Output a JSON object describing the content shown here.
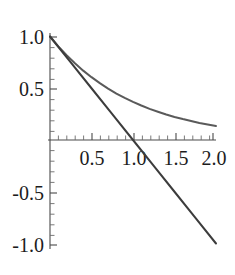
{
  "chart_data": {
    "type": "line",
    "title": "",
    "subtitle": "",
    "xlabel": "",
    "ylabel": "",
    "xlim": [
      0,
      2.05
    ],
    "ylim": [
      -1.08,
      1.05
    ],
    "grid": false,
    "legend": null,
    "axes_cross_at_origin": true,
    "x_ticks_major": [
      0.5,
      1.0,
      1.5,
      2.0
    ],
    "x_tick_labels": [
      "0.5",
      "1.0",
      "1.5",
      "2.0"
    ],
    "y_ticks_major": [
      1.0,
      0.5,
      -0.5,
      -1.0
    ],
    "y_tick_labels": [
      "1.0",
      "0.5",
      "-0.5",
      "-1.0"
    ],
    "x_minor_step": 0.1,
    "y_minor_step": 0.1,
    "series": [
      {
        "name": "exponential-decay",
        "expression": "e^(-x)",
        "color": "#5a5a5a",
        "stroke_width": 2.0,
        "x": [
          0.0,
          0.1,
          0.2,
          0.3,
          0.4,
          0.5,
          0.6,
          0.7,
          0.8,
          0.9,
          1.0,
          1.1,
          1.2,
          1.3,
          1.4,
          1.5,
          1.6,
          1.7,
          1.8,
          1.9,
          2.0
        ],
        "values": [
          1.0,
          0.905,
          0.819,
          0.741,
          0.67,
          0.607,
          0.549,
          0.497,
          0.449,
          0.407,
          0.368,
          0.333,
          0.301,
          0.273,
          0.247,
          0.223,
          0.202,
          0.183,
          0.165,
          0.15,
          0.135
        ]
      },
      {
        "name": "tangent-line",
        "expression": "1 - x",
        "color": "#3c3c3c",
        "stroke_width": 2.0,
        "x": [
          0.0,
          0.25,
          0.5,
          0.75,
          1.0,
          1.25,
          1.5,
          1.75,
          2.0
        ],
        "values": [
          1.0,
          0.75,
          0.5,
          0.25,
          0.0,
          -0.25,
          -0.5,
          -0.75,
          -1.0
        ]
      }
    ]
  },
  "labels": {
    "y_1_0": "1.0",
    "y_0_5": "0.5",
    "y_neg_0_5": "-0.5",
    "y_neg_1_0": "-1.0",
    "x_0_5": "0.5",
    "x_1_0": "1.0",
    "x_1_5": "1.5",
    "x_2_0": "2.0"
  }
}
